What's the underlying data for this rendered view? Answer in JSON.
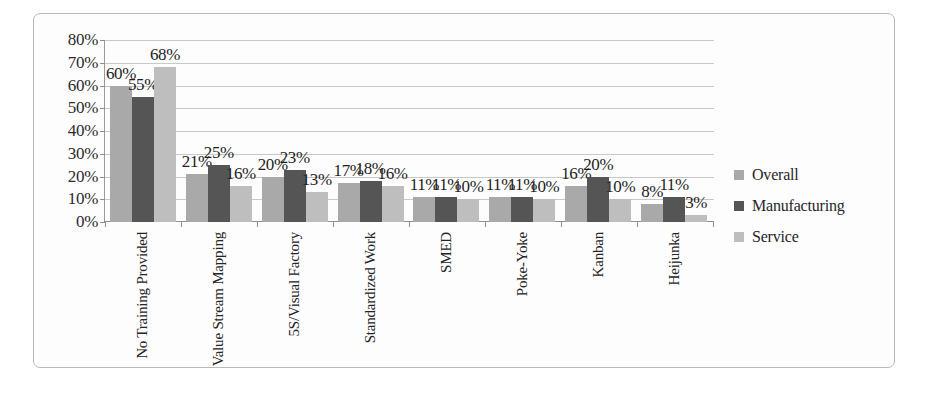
{
  "chart_data": {
    "type": "bar",
    "title": "",
    "xlabel": "",
    "ylabel": "",
    "ylim": [
      0,
      80
    ],
    "y_ticks": [
      "0%",
      "10%",
      "20%",
      "30%",
      "40%",
      "50%",
      "60%",
      "70%",
      "80%"
    ],
    "y_tick_values": [
      0,
      10,
      20,
      30,
      40,
      50,
      60,
      70,
      80
    ],
    "grid": true,
    "legend_position": "right",
    "value_suffix": "%",
    "categories": [
      "No Training Provided",
      "Value Stream Mapping",
      "5S/Visual Factory",
      "Standardized Work",
      "SMED",
      "Poke-Yoke",
      "Kanban",
      "Heijunka"
    ],
    "series": [
      {
        "name": "Overall",
        "color": "#a9a9a9",
        "values": [
          60,
          21,
          20,
          17,
          11,
          11,
          16,
          8
        ],
        "labels": [
          "60%",
          "21%",
          "20%",
          "17%",
          "11%",
          "11%",
          "16%",
          "8%"
        ]
      },
      {
        "name": "Manufacturing",
        "color": "#555555",
        "values": [
          55,
          25,
          23,
          18,
          11,
          11,
          20,
          11
        ],
        "labels": [
          "55%",
          "25%",
          "23%",
          "18%",
          "11%",
          "11%",
          "20%",
          "11%"
        ]
      },
      {
        "name": "Service",
        "color": "#bebebe",
        "values": [
          68,
          16,
          13,
          16,
          10,
          10,
          10,
          3
        ],
        "labels": [
          "68%",
          "16%",
          "13%",
          "16%",
          "10%",
          "10%",
          "10%",
          "3%"
        ]
      }
    ]
  }
}
